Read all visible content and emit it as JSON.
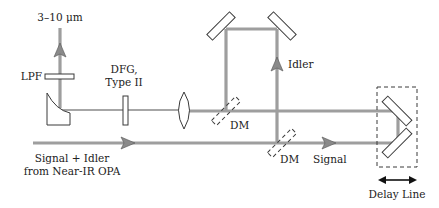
{
  "diagram": {
    "labels": {
      "output": "3–10 μm",
      "lpf": "LPF",
      "dfg_line1": "DFG,",
      "dfg_line2": "Type II",
      "idler": "Idler",
      "dm1": "DM",
      "dm2": "DM",
      "signal": "Signal",
      "input_line1": "Signal + Idler",
      "input_line2": "from Near-IR OPA",
      "delay_line": "Delay Line"
    },
    "components": [
      {
        "id": "long-pass-filter",
        "label": "LPF"
      },
      {
        "id": "off-axis-parabolic-mirror",
        "label": ""
      },
      {
        "id": "dfg-crystal",
        "label": "DFG, Type II"
      },
      {
        "id": "focusing-lens",
        "label": ""
      },
      {
        "id": "dichroic-mirror-1",
        "label": "DM"
      },
      {
        "id": "dichroic-mirror-2",
        "label": "DM"
      },
      {
        "id": "idler-mirror-left",
        "label": ""
      },
      {
        "id": "idler-mirror-right",
        "label": ""
      },
      {
        "id": "delay-line-mirrors",
        "label": "Delay Line"
      }
    ],
    "colors": {
      "beam": "#9e9e9e",
      "outline": "#3a3a3a",
      "arrow": "#8a8a8a",
      "text": "#222222"
    }
  }
}
